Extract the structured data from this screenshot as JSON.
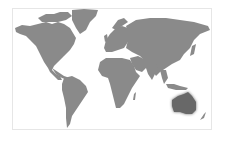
{
  "map": {
    "type": "world-map",
    "land_color": "#8a8a8a",
    "highlight_color": "#676767",
    "frame_color": "#e6e6e6",
    "highlighted_region": "Australia",
    "regions": [
      "North America",
      "Greenland",
      "South America",
      "Europe",
      "Africa",
      "Asia",
      "Australia",
      "New Zealand"
    ]
  }
}
